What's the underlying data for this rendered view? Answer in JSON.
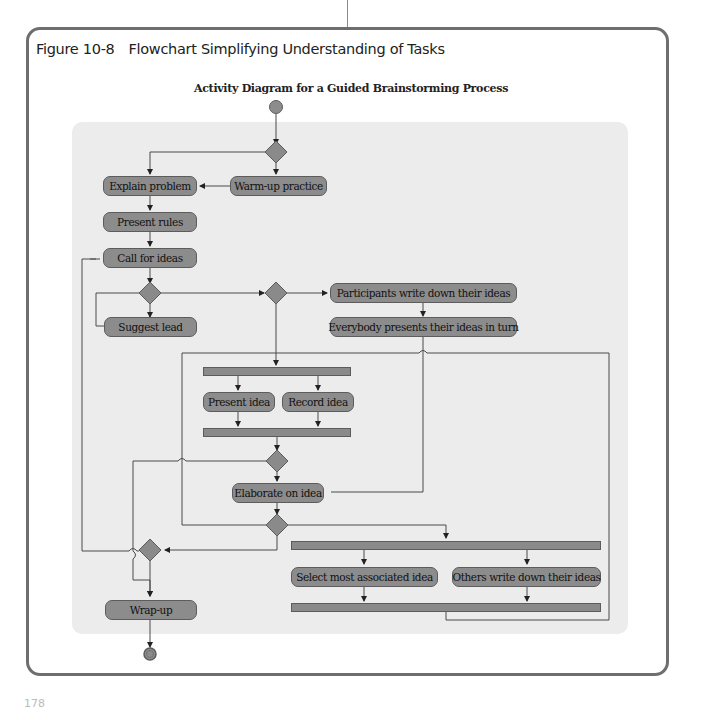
{
  "figure": {
    "number": "Figure 10-8",
    "caption": "Flowchart Simplifying Understanding of Tasks"
  },
  "diagram": {
    "title": "Activity Diagram for a Guided Brainstorming Process",
    "colors": {
      "node_fill": "#8c8c8c",
      "node_border": "#5c5c5c",
      "panel_bg": "#ececec",
      "frame_border": "#6e6e6e",
      "line": "#4a4a4a"
    },
    "nodes": {
      "explain_problem": "Explain problem",
      "warm_up": "Warm-up practice",
      "present_rules": "Present rules",
      "call_for_ideas": "Call for ideas",
      "suggest_lead": "Suggest lead",
      "participants_write": "Participants write down their ideas",
      "everybody_presents": "Everybody presents their ideas in turn",
      "present_idea": "Present idea",
      "record_idea": "Record idea",
      "elaborate": "Elaborate on idea",
      "select_associated": "Select most associated idea",
      "others_write": "Others write down their ideas",
      "wrap_up": "Wrap-up"
    },
    "start_node": "initial-state",
    "end_node": "final-state"
  },
  "page": {
    "number": "178"
  }
}
